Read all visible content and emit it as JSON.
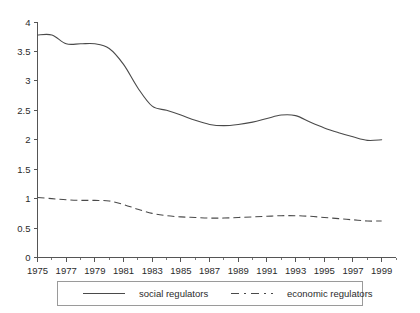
{
  "chart_data": {
    "type": "line",
    "title": "",
    "subtitle": "",
    "xlabel": "",
    "ylabel": "",
    "xlim": [
      1975,
      2000
    ],
    "ylim": [
      0,
      4
    ],
    "grid": false,
    "legend_position": "bottom",
    "y_ticks": [
      "0",
      "0.5",
      "1",
      "1.5",
      "2",
      "2.5",
      "3",
      "3.5",
      "4"
    ],
    "y_tick_values": [
      0,
      0.5,
      1,
      1.5,
      2,
      2.5,
      3,
      3.5,
      4
    ],
    "x_ticks": [
      "1975",
      "1977",
      "1979",
      "1981",
      "1983",
      "1985",
      "1987",
      "1989",
      "1991",
      "1993",
      "1995",
      "1997",
      "1999"
    ],
    "x_tick_values": [
      1975,
      1977,
      1979,
      1981,
      1983,
      1985,
      1987,
      1989,
      1991,
      1993,
      1995,
      1997,
      1999
    ],
    "x_minor_tick_values": [
      1976,
      1978,
      1980,
      1982,
      1984,
      1986,
      1988,
      1990,
      1992,
      1994,
      1996,
      1998,
      2000
    ],
    "x": [
      1975,
      1976,
      1977,
      1978,
      1979,
      1980,
      1981,
      1982,
      1983,
      1984,
      1985,
      1986,
      1987,
      1988,
      1989,
      1990,
      1991,
      1992,
      1993,
      1994,
      1995,
      1996,
      1997,
      1998,
      1999
    ],
    "series": [
      {
        "name": "social regulators",
        "style": "solid",
        "color": "#4a4a4a",
        "values": [
          3.78,
          3.78,
          3.63,
          3.63,
          3.63,
          3.55,
          3.28,
          2.88,
          2.57,
          2.5,
          2.42,
          2.33,
          2.26,
          2.24,
          2.26,
          2.3,
          2.36,
          2.42,
          2.41,
          2.3,
          2.2,
          2.12,
          2.05,
          1.99,
          2.0
        ]
      },
      {
        "name": "economic regulators",
        "style": "dashed",
        "color": "#4a4a4a",
        "values": [
          1.02,
          1.0,
          0.98,
          0.97,
          0.97,
          0.96,
          0.9,
          0.82,
          0.75,
          0.71,
          0.69,
          0.68,
          0.67,
          0.67,
          0.68,
          0.69,
          0.7,
          0.71,
          0.71,
          0.7,
          0.68,
          0.66,
          0.64,
          0.62,
          0.62
        ]
      }
    ]
  },
  "legend": {
    "entries": [
      {
        "label": "social regulators",
        "style": "solid"
      },
      {
        "label": "economic regulators",
        "style": "dashed"
      }
    ]
  }
}
